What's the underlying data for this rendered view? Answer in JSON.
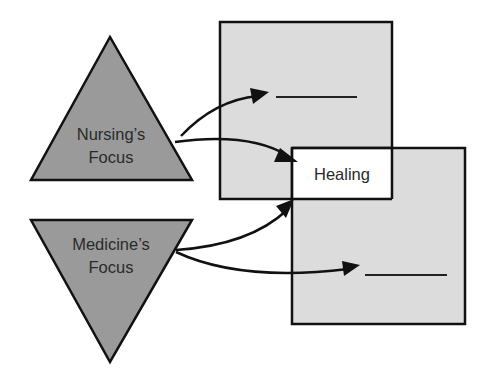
{
  "diagram": {
    "nursing": {
      "line1": "Nursing’s",
      "line2": "Focus"
    },
    "medicine": {
      "line1": "Medicine’s",
      "line2": "Focus"
    },
    "overlap": {
      "label": "Healing"
    },
    "top_box": {
      "blank": "______"
    },
    "bottom_box": {
      "blank": "______"
    }
  },
  "colors": {
    "triangle_fill": "#9a9a9a",
    "box_fill": "#dcdcdc",
    "overlap_fill": "#ffffff",
    "stroke": "#111111"
  }
}
